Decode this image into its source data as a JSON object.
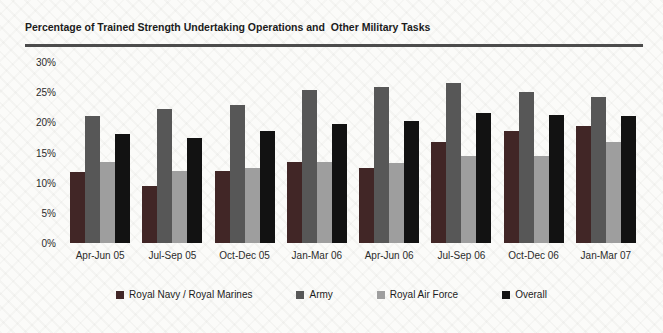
{
  "title": "Percentage of Trained Strength Undertaking Operations and  Other Military Tasks",
  "chart_data": {
    "type": "bar",
    "title": "Percentage of Trained Strength Undertaking Operations and  Other Military Tasks",
    "categories": [
      "Apr-Jun 05",
      "Jul-Sep 05",
      "Oct-Dec 05",
      "Jan-Mar 06",
      "Apr-Jun 06",
      "Jul-Sep 06",
      "Oct-Dec 06",
      "Jan-Mar 07"
    ],
    "series": [
      {
        "name": "Royal Navy / Royal Marines",
        "color": "#412626",
        "values": [
          11.7,
          9.4,
          11.9,
          13.4,
          12.4,
          16.7,
          18.6,
          19.4
        ]
      },
      {
        "name": "Army",
        "color": "#575757",
        "values": [
          21.1,
          22.2,
          22.9,
          25.3,
          25.9,
          26.5,
          25.1,
          24.2
        ]
      },
      {
        "name": "Royal Air Force",
        "color": "#9e9e9e",
        "values": [
          13.4,
          12.0,
          12.4,
          13.5,
          13.3,
          14.4,
          14.5,
          16.8
        ]
      },
      {
        "name": "Overall",
        "color": "#121212",
        "values": [
          18.0,
          17.4,
          18.6,
          19.8,
          20.2,
          21.6,
          21.3,
          21.0
        ]
      }
    ],
    "xlabel": "",
    "ylabel": "",
    "yticks": [
      "30%",
      "25%",
      "20%",
      "15%",
      "10%",
      "5%",
      "0%"
    ],
    "ylim": [
      0,
      30
    ],
    "grid": false,
    "legend_position": "bottom"
  }
}
